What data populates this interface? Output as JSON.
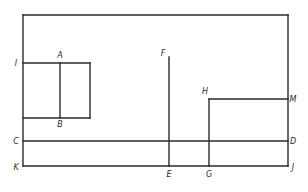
{
  "diagram": {
    "stroke_color": "#2a2a2a",
    "background": "#ffffff",
    "points": {
      "A": {
        "label": "A",
        "x": 60,
        "y": 58
      },
      "B": {
        "label": "B",
        "x": 60,
        "y": 127
      },
      "C": {
        "label": "C",
        "x": 16,
        "y": 144
      },
      "D": {
        "label": "D",
        "x": 293,
        "y": 144
      },
      "E": {
        "label": "E",
        "x": 169,
        "y": 177
      },
      "F": {
        "label": "F",
        "x": 163,
        "y": 56
      },
      "G": {
        "label": "G",
        "x": 209,
        "y": 177
      },
      "H": {
        "label": "H",
        "x": 205,
        "y": 94
      },
      "I": {
        "label": "I",
        "x": 16,
        "y": 66
      },
      "J": {
        "label": "J",
        "x": 293,
        "y": 170
      },
      "K": {
        "label": "K",
        "x": 16,
        "y": 170
      },
      "M": {
        "label": "M",
        "x": 293,
        "y": 102
      }
    },
    "segments": [
      {
        "name": "top-edge",
        "x1": 23,
        "y1": 15,
        "x2": 288,
        "y2": 15
      },
      {
        "name": "left-edge-K",
        "x1": 23,
        "y1": 15,
        "x2": 23,
        "y2": 166
      },
      {
        "name": "right-edge-J",
        "x1": 288,
        "y1": 15,
        "x2": 288,
        "y2": 166
      },
      {
        "name": "KJ",
        "x1": 23,
        "y1": 166,
        "x2": 288,
        "y2": 166
      },
      {
        "name": "CD",
        "x1": 23,
        "y1": 141,
        "x2": 288,
        "y2": 141
      },
      {
        "name": "I-top",
        "x1": 23,
        "y1": 63,
        "x2": 90,
        "y2": 63
      },
      {
        "name": "box-bottom",
        "x1": 23,
        "y1": 118,
        "x2": 90,
        "y2": 118
      },
      {
        "name": "box-right",
        "x1": 90,
        "y1": 63,
        "x2": 90,
        "y2": 118
      },
      {
        "name": "AB",
        "x1": 60,
        "y1": 63,
        "x2": 60,
        "y2": 118
      },
      {
        "name": "FE",
        "x1": 169,
        "y1": 57,
        "x2": 169,
        "y2": 166
      },
      {
        "name": "HM",
        "x1": 209,
        "y1": 99,
        "x2": 288,
        "y2": 99
      },
      {
        "name": "HG",
        "x1": 209,
        "y1": 99,
        "x2": 209,
        "y2": 166
      }
    ]
  }
}
